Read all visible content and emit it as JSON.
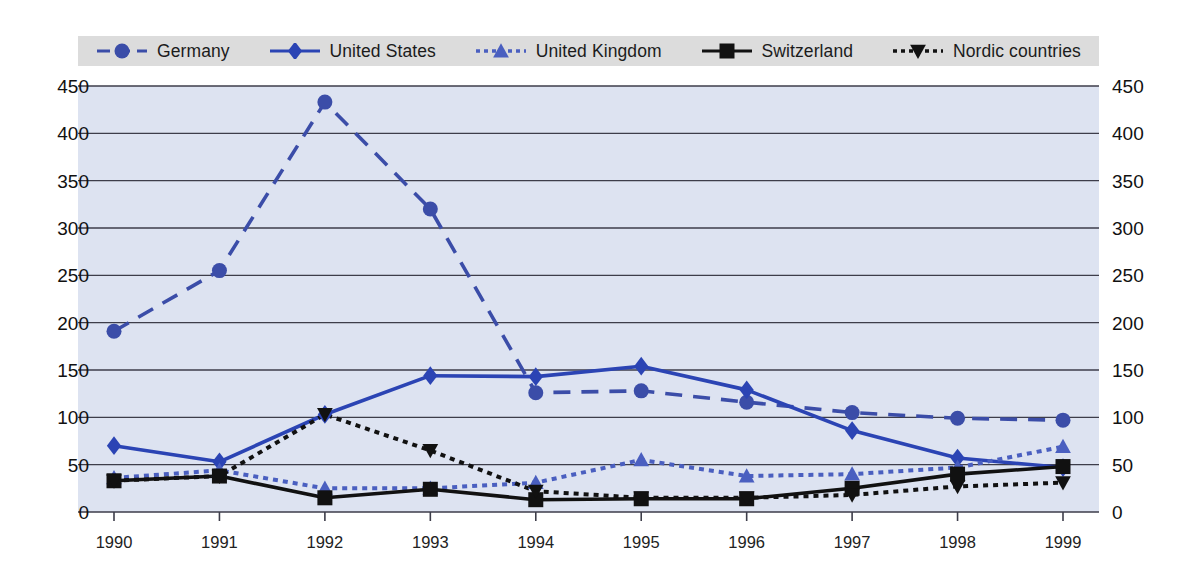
{
  "chart_data": {
    "type": "line",
    "title": "",
    "xlabel": "",
    "ylabel": "",
    "x": [
      "1990",
      "1991",
      "1992",
      "1993",
      "1994",
      "1995",
      "1996",
      "1997",
      "1998",
      "1999"
    ],
    "ylim": [
      0,
      450
    ],
    "yticks": [
      0,
      50,
      100,
      150,
      200,
      250,
      300,
      350,
      400,
      450
    ],
    "ytick_labels": [
      "0",
      "50",
      "100",
      "150",
      "200",
      "250",
      "300",
      "350",
      "400",
      "450"
    ],
    "dual_axis": true,
    "grid": true,
    "grid_axis": "y",
    "legend_position": "top",
    "plot_background": "#dde3f1",
    "legend_background": "#dcdcdc",
    "series": [
      {
        "name": "Germany",
        "marker": "circle",
        "dash": "dashed",
        "color": "#3b4da8",
        "values": [
          191,
          255,
          433,
          320,
          126,
          128,
          116,
          105,
          99,
          97
        ]
      },
      {
        "name": "United States",
        "marker": "diamond",
        "dash": "solid",
        "color": "#2b44b4",
        "values": [
          70,
          53,
          103,
          144,
          143,
          154,
          129,
          86,
          57,
          47
        ]
      },
      {
        "name": "United Kingdom",
        "marker": "triangle-up",
        "dash": "dotted",
        "color": "#4a5fc0",
        "values": [
          36,
          44,
          25,
          25,
          31,
          55,
          38,
          40,
          47,
          69
        ]
      },
      {
        "name": "Switzerland",
        "marker": "square",
        "dash": "solid",
        "color": "#111111",
        "values": [
          33,
          38,
          15,
          24,
          13,
          14,
          14,
          25,
          40,
          48
        ]
      },
      {
        "name": "Nordic countries",
        "marker": "triangle-down",
        "dash": "dotted",
        "color": "#111111",
        "values": [
          33,
          38,
          103,
          65,
          22,
          15,
          15,
          18,
          27,
          31
        ]
      }
    ]
  },
  "legend": {
    "items": [
      {
        "label": "Germany"
      },
      {
        "label": "United States"
      },
      {
        "label": "United Kingdom"
      },
      {
        "label": "Switzerland"
      },
      {
        "label": "Nordic countries"
      }
    ]
  }
}
